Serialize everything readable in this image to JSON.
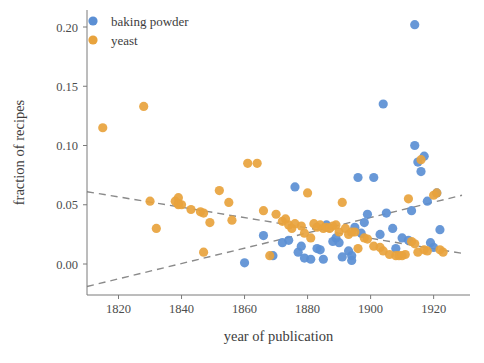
{
  "chart_data": {
    "type": "scatter",
    "title": "",
    "xlabel": "year of publication",
    "ylabel": "fraction of recipes",
    "xlim": [
      1810,
      1929
    ],
    "ylim": [
      -0.028,
      0.215
    ],
    "xticks": [
      1820,
      1840,
      1860,
      1880,
      1900,
      1920
    ],
    "xticklabels": [
      "1820",
      "1840",
      "1860",
      "1880",
      "1900",
      "1920"
    ],
    "yticks": [
      0.0,
      0.05,
      0.1,
      0.15,
      0.2
    ],
    "yticklabels": [
      "0.00",
      "0.05",
      "0.10",
      "0.15",
      "0.20"
    ],
    "grid": false,
    "legend_position": "upper left",
    "colors": {
      "baking_powder": "#5B8FD4",
      "yeast": "#E8A33D",
      "trendline": "#8a8a8a",
      "axis": "#7a7a7a",
      "text": "#3d3d3d",
      "background": "#ffffff"
    },
    "series": [
      {
        "name": "baking powder",
        "color": "#5B8FD4",
        "marker": "circle",
        "points": [
          [
            1860,
            0.001
          ],
          [
            1866,
            0.024
          ],
          [
            1869,
            0.007
          ],
          [
            1872,
            0.018
          ],
          [
            1874,
            0.02
          ],
          [
            1876,
            0.065
          ],
          [
            1877,
            0.01
          ],
          [
            1878,
            0.015
          ],
          [
            1879,
            0.005
          ],
          [
            1881,
            0.004
          ],
          [
            1883,
            0.013
          ],
          [
            1884,
            0.012
          ],
          [
            1885,
            0.004
          ],
          [
            1886,
            0.033
          ],
          [
            1888,
            0.019
          ],
          [
            1889,
            0.022
          ],
          [
            1890,
            0.018
          ],
          [
            1891,
            0.006
          ],
          [
            1893,
            0.011
          ],
          [
            1894,
            0.007
          ],
          [
            1894,
            0.003
          ],
          [
            1895,
            0.031
          ],
          [
            1896,
            0.073
          ],
          [
            1897,
            0.026
          ],
          [
            1898,
            0.035
          ],
          [
            1899,
            0.042
          ],
          [
            1901,
            0.073
          ],
          [
            1903,
            0.025
          ],
          [
            1904,
            0.135
          ],
          [
            1905,
            0.043
          ],
          [
            1907,
            0.03
          ],
          [
            1908,
            0.013
          ],
          [
            1910,
            0.022
          ],
          [
            1912,
            0.02
          ],
          [
            1913,
            0.045
          ],
          [
            1914,
            0.202
          ],
          [
            1914,
            0.1
          ],
          [
            1915,
            0.086
          ],
          [
            1916,
            0.078
          ],
          [
            1917,
            0.091
          ],
          [
            1918,
            0.053
          ],
          [
            1919,
            0.018
          ],
          [
            1920,
            0.014
          ],
          [
            1921,
            0.06
          ],
          [
            1922,
            0.029
          ]
        ]
      },
      {
        "name": "yeast",
        "color": "#E8A33D",
        "marker": "circle",
        "points": [
          [
            1815,
            0.115
          ],
          [
            1828,
            0.133
          ],
          [
            1830,
            0.053
          ],
          [
            1832,
            0.03
          ],
          [
            1838,
            0.053
          ],
          [
            1839,
            0.056
          ],
          [
            1839,
            0.051
          ],
          [
            1839,
            0.05
          ],
          [
            1840,
            0.05
          ],
          [
            1843,
            0.046
          ],
          [
            1846,
            0.044
          ],
          [
            1847,
            0.043
          ],
          [
            1847,
            0.01
          ],
          [
            1849,
            0.035
          ],
          [
            1852,
            0.062
          ],
          [
            1855,
            0.052
          ],
          [
            1856,
            0.037
          ],
          [
            1861,
            0.085
          ],
          [
            1864,
            0.085
          ],
          [
            1866,
            0.045
          ],
          [
            1868,
            0.007
          ],
          [
            1870,
            0.042
          ],
          [
            1872,
            0.036
          ],
          [
            1873,
            0.038
          ],
          [
            1874,
            0.033
          ],
          [
            1875,
            0.03
          ],
          [
            1876,
            0.034
          ],
          [
            1878,
            0.032
          ],
          [
            1879,
            0.026
          ],
          [
            1880,
            0.06
          ],
          [
            1881,
            0.022
          ],
          [
            1882,
            0.034
          ],
          [
            1883,
            0.031
          ],
          [
            1884,
            0.033
          ],
          [
            1885,
            0.03
          ],
          [
            1886,
            0.031
          ],
          [
            1887,
            0.03
          ],
          [
            1888,
            0.032
          ],
          [
            1889,
            0.033
          ],
          [
            1890,
            0.027
          ],
          [
            1891,
            0.052
          ],
          [
            1892,
            0.03
          ],
          [
            1893,
            0.025
          ],
          [
            1894,
            0.027
          ],
          [
            1895,
            0.027
          ],
          [
            1896,
            0.013
          ],
          [
            1898,
            0.022
          ],
          [
            1899,
            0.021
          ],
          [
            1901,
            0.015
          ],
          [
            1903,
            0.014
          ],
          [
            1904,
            0.011
          ],
          [
            1906,
            0.008
          ],
          [
            1908,
            0.007
          ],
          [
            1909,
            0.007
          ],
          [
            1910,
            0.007
          ],
          [
            1911,
            0.008
          ],
          [
            1912,
            0.055
          ],
          [
            1913,
            0.019
          ],
          [
            1914,
            0.017
          ],
          [
            1915,
            0.01
          ],
          [
            1916,
            0.088
          ],
          [
            1917,
            0.012
          ],
          [
            1918,
            0.011
          ],
          [
            1920,
            0.058
          ],
          [
            1921,
            0.06
          ],
          [
            1922,
            0.012
          ],
          [
            1923,
            0.01
          ]
        ]
      }
    ],
    "trendlines": [
      {
        "name": "yeast-trend",
        "x": [
          1810,
          1929
        ],
        "y": [
          0.061,
          0.009
        ],
        "style": "dashed",
        "color": "#8a8a8a"
      },
      {
        "name": "baking-powder-trend",
        "x": [
          1810,
          1929
        ],
        "y": [
          -0.019,
          0.058
        ],
        "style": "dashed",
        "color": "#8a8a8a"
      }
    ],
    "legend": [
      {
        "label": "baking powder",
        "color": "#5B8FD4"
      },
      {
        "label": "yeast",
        "color": "#E8A33D"
      }
    ]
  }
}
